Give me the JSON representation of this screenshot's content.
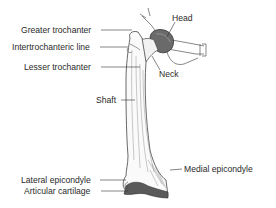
{
  "diagram": {
    "labels": {
      "head": "Head",
      "greater_trochanter": "Greater trochanter",
      "intertrochanteric_line": "Intertrochanteric line",
      "lesser_trochanter": "Lesser trochanter",
      "neck": "Neck",
      "shaft": "Shaft",
      "medial_epicondyle": "Medial epicondyle",
      "lateral_epicondyle": "Lateral epicondyle",
      "articular_cartilage": "Articular cartilage"
    }
  }
}
